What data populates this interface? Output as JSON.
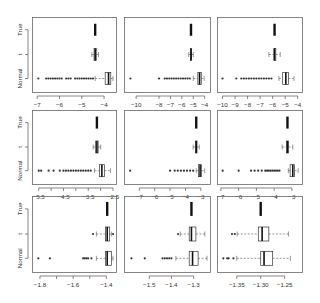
{
  "chart_data": {
    "type": "boxplot-grid",
    "layout": {
      "rows": 3,
      "cols": 3,
      "orientation": "horizontal"
    },
    "categories": [
      "Normal",
      "t",
      "True"
    ],
    "panels": [
      {
        "id": "r1c1",
        "xlim": [
          -7.1,
          -3.6
        ],
        "ticks": [
          -7,
          -6,
          -5,
          -4
        ],
        "tick_labels": [
          "-7",
          "-6",
          "-5",
          "-4"
        ],
        "groups": [
          {
            "name": "Normal",
            "whisker_low": -4.4,
            "q1": -3.95,
            "median": -3.8,
            "q3": -3.7,
            "whisker_high": -3.6,
            "outliers": [
              -6.95,
              -6.6,
              -6.5,
              -6.4,
              -6.3,
              -6.2,
              -6.1,
              -6.0,
              -5.9,
              -5.7,
              -5.6,
              -5.5,
              -5.3,
              -5.2,
              -5.1,
              -5.0,
              -4.9,
              -4.8,
              -4.7,
              -4.6,
              -4.5
            ]
          },
          {
            "name": "t",
            "whisker_low": -4.55,
            "q1": -4.45,
            "median": -4.4,
            "q3": -4.35,
            "whisker_high": -4.25,
            "outliers": []
          },
          {
            "name": "True",
            "whisker_low": -4.4,
            "q1": -4.4,
            "median": -4.4,
            "q3": -4.4,
            "whisker_high": -4.4,
            "outliers": []
          }
        ]
      },
      {
        "id": "r1c2",
        "xlim": [
          -10.8,
          -3.8
        ],
        "ticks": [
          -10,
          -8,
          -7,
          -6,
          -5,
          -4
        ],
        "tick_labels": [
          "-10",
          "-8",
          "-7",
          "-6",
          "-5",
          "-4"
        ],
        "groups": [
          {
            "name": "Normal",
            "whisker_low": -5.0,
            "q1": -4.6,
            "median": -4.45,
            "q3": -4.3,
            "whisker_high": -4.05,
            "outliers": [
              -10.5,
              -8.0,
              -7.5,
              -7.3,
              -7.1,
              -6.9,
              -6.7,
              -6.5,
              -6.3,
              -6.1,
              -5.9,
              -5.7,
              -5.5,
              -5.3
            ]
          },
          {
            "name": "t",
            "whisker_low": -5.4,
            "q1": -5.25,
            "median": -5.2,
            "q3": -5.15,
            "whisker_high": -5.0,
            "outliers": []
          },
          {
            "name": "True",
            "whisker_low": -5.2,
            "q1": -5.2,
            "median": -5.2,
            "q3": -5.2,
            "whisker_high": -5.2,
            "outliers": []
          }
        ]
      },
      {
        "id": "r1c3",
        "xlim": [
          -10.2,
          -3.9
        ],
        "ticks": [
          -10,
          -9,
          -8,
          -7,
          -6,
          -5,
          -4
        ],
        "tick_labels": [
          "-10",
          "-9",
          "-8",
          "-7",
          "-6",
          "-5",
          "-4"
        ],
        "groups": [
          {
            "name": "Normal",
            "whisker_low": -5.5,
            "q1": -5.2,
            "median": -4.95,
            "q3": -4.75,
            "whisker_high": -4.3,
            "outliers": [
              -10.0,
              -8.9,
              -8.5,
              -8.3,
              -8.1,
              -7.9,
              -7.7,
              -7.5,
              -7.3,
              -7.1,
              -6.9,
              -6.7,
              -6.5,
              -6.3,
              -6.1
            ]
          },
          {
            "name": "t",
            "whisker_low": -6.3,
            "q1": -5.9,
            "median": -5.85,
            "q3": -5.75,
            "whisker_high": -5.4,
            "outliers": []
          },
          {
            "name": "True",
            "whisker_low": -5.85,
            "q1": -5.85,
            "median": -5.85,
            "q3": -5.85,
            "whisker_high": -5.85,
            "outliers": []
          }
        ]
      },
      {
        "id": "r2c1",
        "xlim": [
          -5.65,
          -2.5
        ],
        "ticks": [
          -5.5,
          -5.0,
          -4.5,
          -4.0,
          -3.5,
          -3.0,
          -2.5
        ],
        "tick_labels": [
          "-5.5",
          "",
          "-4.5",
          "",
          "-3.5",
          "",
          "-2.5"
        ],
        "groups": [
          {
            "name": "Normal",
            "whisker_low": -3.25,
            "q1": -3.05,
            "median": -2.95,
            "q3": -2.85,
            "whisker_high": -2.6,
            "outliers": [
              -5.5,
              -5.4,
              -5.1,
              -4.9,
              -4.65,
              -4.5,
              -4.4,
              -4.3,
              -4.2,
              -4.1,
              -4.0,
              -3.9,
              -3.8,
              -3.7,
              -3.6,
              -3.5,
              -3.4
            ]
          },
          {
            "name": "t",
            "whisker_low": -3.3,
            "q1": -3.2,
            "median": -3.15,
            "q3": -3.1,
            "whisker_high": -3.0,
            "outliers": []
          },
          {
            "name": "True",
            "whisker_low": -3.15,
            "q1": -3.15,
            "median": -3.15,
            "q3": -3.15,
            "whisker_high": -3.15,
            "outliers": []
          }
        ]
      },
      {
        "id": "r2c2",
        "xlim": [
          -7.8,
          -2.6
        ],
        "ticks": [
          -7,
          -6,
          -5,
          -4,
          -3
        ],
        "tick_labels": [
          "-7",
          "-6",
          "-5",
          "-4",
          "-3"
        ],
        "groups": [
          {
            "name": "Normal",
            "whisker_low": -3.3,
            "q1": -3.15,
            "median": -3.05,
            "q3": -2.95,
            "whisker_high": -2.75,
            "outliers": [
              -7.6,
              -5.0,
              -4.7,
              -4.5,
              -4.3,
              -4.1,
              -3.9,
              -3.7,
              -3.5
            ]
          },
          {
            "name": "t",
            "whisker_low": -3.5,
            "q1": -3.35,
            "median": -3.3,
            "q3": -3.25,
            "whisker_high": -3.1,
            "outliers": []
          },
          {
            "name": "True",
            "whisker_low": -3.3,
            "q1": -3.3,
            "median": -3.3,
            "q3": -3.3,
            "whisker_high": -3.3,
            "outliers": []
          }
        ]
      },
      {
        "id": "r2c3",
        "xlim": [
          -7.05,
          -2.6
        ],
        "ticks": [
          -7,
          -6,
          -5,
          -4,
          -3
        ],
        "tick_labels": [
          "-7",
          "-6",
          "-5",
          "-4",
          "-3"
        ],
        "groups": [
          {
            "name": "Normal",
            "whisker_low": -3.2,
            "q1": -3.1,
            "median": -2.95,
            "q3": -2.85,
            "whisker_high": -2.65,
            "outliers": [
              -6.9,
              -6.0,
              -5.3,
              -5.1,
              -4.9,
              -4.7,
              -4.5,
              -4.4,
              -4.3,
              -4.2,
              -4.1,
              -4.0,
              -3.9,
              -3.8,
              -3.7
            ]
          },
          {
            "name": "t",
            "whisker_low": -3.55,
            "q1": -3.3,
            "median": -3.25,
            "q3": -3.2,
            "whisker_high": -2.95,
            "outliers": []
          },
          {
            "name": "True",
            "whisker_low": -3.25,
            "q1": -3.25,
            "median": -3.25,
            "q3": -3.25,
            "whisker_high": -3.25,
            "outliers": []
          }
        ]
      },
      {
        "id": "r3c1",
        "xlim": [
          -1.83,
          -1.36
        ],
        "ticks": [
          -1.8,
          -1.7,
          -1.6,
          -1.5,
          -1.4
        ],
        "tick_labels": [
          "-1.8",
          "",
          "-1.6",
          "",
          "-1.4"
        ],
        "groups": [
          {
            "name": "Normal",
            "whisker_low": -1.46,
            "q1": -1.405,
            "median": -1.395,
            "q3": -1.37,
            "whisker_high": -1.36,
            "outliers": [
              -1.81,
              -1.74,
              -1.54,
              -1.53,
              -1.52,
              -1.51,
              -1.49
            ]
          },
          {
            "name": "t",
            "whisker_low": -1.46,
            "q1": -1.405,
            "median": -1.395,
            "q3": -1.38,
            "whisker_high": -1.37,
            "outliers": [
              -1.48,
              -1.36
            ]
          },
          {
            "name": "True",
            "whisker_low": -1.395,
            "q1": -1.395,
            "median": -1.395,
            "q3": -1.395,
            "whisker_high": -1.395,
            "outliers": []
          }
        ]
      },
      {
        "id": "r3c2",
        "xlim": [
          -1.6,
          -1.24
        ],
        "ticks": [
          -1.5,
          -1.4,
          -1.3
        ],
        "tick_labels": [
          "-1.5",
          "-1.4",
          "-1.3"
        ],
        "groups": [
          {
            "name": "Normal",
            "whisker_low": -1.38,
            "q1": -1.32,
            "median": -1.305,
            "q3": -1.28,
            "whisker_high": -1.24,
            "outliers": [
              -1.58,
              -1.52,
              -1.44,
              -1.43,
              -1.42,
              -1.41,
              -1.4
            ]
          },
          {
            "name": "t",
            "whisker_low": -1.36,
            "q1": -1.32,
            "median": -1.31,
            "q3": -1.29,
            "whisker_high": -1.25,
            "outliers": [
              -1.37
            ]
          },
          {
            "name": "True",
            "whisker_low": -1.31,
            "q1": -1.31,
            "median": -1.31,
            "q3": -1.31,
            "whisker_high": -1.31,
            "outliers": []
          }
        ]
      },
      {
        "id": "r3c3",
        "xlim": [
          -1.385,
          -1.22
        ],
        "ticks": [
          -1.35,
          -1.3,
          -1.25
        ],
        "tick_labels": [
          "-1.35",
          "-1.30",
          "-1.25"
        ],
        "groups": [
          {
            "name": "Normal",
            "whisker_low": -1.35,
            "q1": -1.3,
            "median": -1.293,
            "q3": -1.275,
            "whisker_high": -1.238,
            "outliers": [
              -1.378,
              -1.37,
              -1.367,
              -1.357
            ]
          },
          {
            "name": "t",
            "whisker_low": -1.349,
            "q1": -1.305,
            "median": -1.297,
            "q3": -1.283,
            "whisker_high": -1.242,
            "outliers": [
              -1.36,
              -1.354
            ]
          },
          {
            "name": "True",
            "whisker_low": -1.3,
            "q1": -1.3,
            "median": -1.3,
            "q3": -1.3,
            "whisker_high": -1.3,
            "outliers": []
          }
        ]
      }
    ]
  }
}
